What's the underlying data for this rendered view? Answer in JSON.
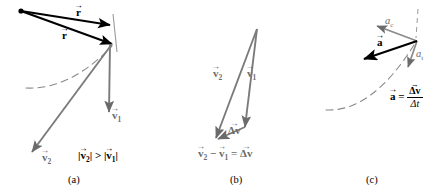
{
  "figure": {
    "colors": {
      "black": "#000000",
      "gray": "#6b6b6b",
      "dashed_path": "#8a8a8a",
      "background": "#ffffff"
    }
  },
  "panels": [
    {
      "id": "a",
      "caption": "(a)",
      "labels": {
        "r_first": "r",
        "r_second": "r",
        "v1": "v",
        "v1_sub": "1",
        "v2": "v",
        "v2_sub": "2"
      },
      "relation": {
        "left_bar_open": "|",
        "left_vec": "v",
        "left_sub": "2",
        "left_bar_close": "|",
        "operator": ">",
        "right_bar_open": "|",
        "right_vec": "v",
        "right_sub": "1",
        "right_bar_close": "|"
      }
    },
    {
      "id": "b",
      "caption": "(b)",
      "labels": {
        "v1": "v",
        "v1_sub": "1",
        "v2": "v",
        "v2_sub": "2",
        "delta_v": "Δv"
      },
      "equation": {
        "term1": "v",
        "term1_sub": "2",
        "minus": "−",
        "term2": "v",
        "term2_sub": "1",
        "equals": "=",
        "result": "Δv"
      }
    },
    {
      "id": "c",
      "caption": "(c)",
      "labels": {
        "a_vector": "a",
        "a_centripetal": "a",
        "a_centripetal_sub": "c",
        "a_tangential": "a",
        "a_tangential_sub": "t"
      },
      "equation": {
        "lhs": "a",
        "equals": "=",
        "numerator": "Δv",
        "denominator": "Δt"
      }
    }
  ]
}
